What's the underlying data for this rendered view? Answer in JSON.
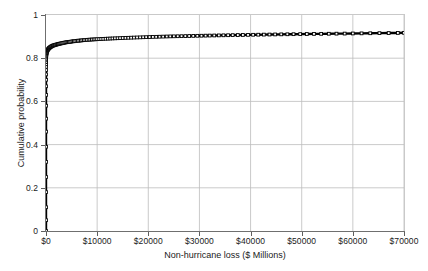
{
  "chart_data": {
    "type": "line",
    "title": "",
    "xlabel": "Non-hurricane loss ($ Millions)",
    "ylabel": "Cumulative probability",
    "xlim": [
      0,
      70000
    ],
    "ylim": [
      0,
      1
    ],
    "grid": true,
    "legend": null,
    "marker": "square",
    "xticks": [
      0,
      10000,
      20000,
      30000,
      40000,
      50000,
      60000,
      70000
    ],
    "xticklabels": [
      "$0",
      "$10000",
      "$20000",
      "$30000",
      "$40000",
      "$50000",
      "$60000",
      "$70000"
    ],
    "yticks": [
      0,
      0.2,
      0.4,
      0.6,
      0.8,
      1
    ],
    "yticklabels": [
      "0",
      "0.2",
      "0.4",
      "0.6",
      "0.8",
      "1"
    ],
    "series": [
      {
        "name": "Non-hurricane loss exceedance curve",
        "x": [
          0,
          0,
          0,
          0,
          0,
          0,
          0,
          0,
          0,
          0,
          0,
          0,
          0,
          0,
          0,
          2,
          5,
          9,
          14,
          20,
          28,
          38,
          50,
          64,
          80,
          100,
          125,
          155,
          190,
          230,
          275,
          325,
          380,
          440,
          505,
          575,
          650,
          730,
          815,
          905,
          1000,
          1105,
          1215,
          1330,
          1450,
          1580,
          1715,
          1855,
          2000,
          2155,
          2315,
          2480,
          2650,
          2830,
          3015,
          3205,
          3400,
          3605,
          3815,
          4030,
          4250,
          4480,
          4715,
          4955,
          5200,
          5455,
          5715,
          5980,
          6250,
          6530,
          6815,
          7105,
          7400,
          7705,
          8015,
          8330,
          8650,
          8980,
          9315,
          9655,
          10000,
          10400,
          10800,
          11200,
          11650,
          12100,
          12550,
          13000,
          13500,
          14000,
          14500,
          15000,
          15550,
          16100,
          16650,
          17200,
          17800,
          18400,
          19000,
          19600,
          20250,
          20900,
          21550,
          22200,
          22900,
          23600,
          24300,
          25000,
          25750,
          26500,
          27250,
          28000,
          28800,
          29600,
          30400,
          31200,
          32000,
          32900,
          33800,
          34700,
          35600,
          36500,
          37500,
          38500,
          39500,
          40500,
          41500,
          42600,
          43700,
          44800,
          46000,
          47200,
          48400,
          49700,
          51000,
          52400,
          53800,
          55300,
          56800,
          58400,
          60000,
          61700,
          63400,
          65200,
          67000,
          68800,
          70000
        ],
        "y": [
          0,
          0.05,
          0.11,
          0.18,
          0.25,
          0.32,
          0.39,
          0.46,
          0.52,
          0.58,
          0.63,
          0.67,
          0.7,
          0.725,
          0.745,
          0.76,
          0.772,
          0.782,
          0.79,
          0.797,
          0.803,
          0.808,
          0.812,
          0.816,
          0.82,
          0.823,
          0.826,
          0.829,
          0.832,
          0.834,
          0.836,
          0.838,
          0.84,
          0.842,
          0.844,
          0.846,
          0.848,
          0.849,
          0.851,
          0.852,
          0.854,
          0.855,
          0.857,
          0.858,
          0.859,
          0.86,
          0.861,
          0.862,
          0.863,
          0.864,
          0.865,
          0.866,
          0.867,
          0.868,
          0.869,
          0.87,
          0.871,
          0.872,
          0.873,
          0.874,
          0.8745,
          0.875,
          0.876,
          0.877,
          0.878,
          0.8785,
          0.879,
          0.88,
          0.881,
          0.8815,
          0.882,
          0.883,
          0.8835,
          0.884,
          0.885,
          0.8855,
          0.886,
          0.8865,
          0.887,
          0.8875,
          0.888,
          0.8885,
          0.889,
          0.8895,
          0.89,
          0.8905,
          0.891,
          0.8915,
          0.892,
          0.8925,
          0.893,
          0.8935,
          0.894,
          0.8945,
          0.895,
          0.8955,
          0.896,
          0.8965,
          0.897,
          0.8975,
          0.898,
          0.8985,
          0.899,
          0.8995,
          0.9,
          0.9005,
          0.901,
          0.9013,
          0.9017,
          0.902,
          0.9024,
          0.9028,
          0.9032,
          0.9036,
          0.904,
          0.9044,
          0.9048,
          0.9052,
          0.9056,
          0.906,
          0.9064,
          0.9068,
          0.9072,
          0.9076,
          0.908,
          0.9084,
          0.9088,
          0.9092,
          0.9096,
          0.91,
          0.9104,
          0.9108,
          0.9112,
          0.9116,
          0.912,
          0.9124,
          0.9128,
          0.9132,
          0.9136,
          0.914,
          0.9145,
          0.915,
          0.9155,
          0.916,
          0.9165,
          0.917,
          0.9175
        ]
      }
    ]
  }
}
